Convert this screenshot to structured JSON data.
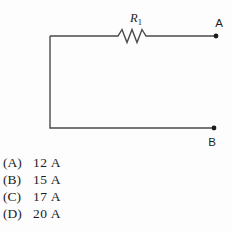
{
  "circuit": {
    "resistor": {
      "base": "R",
      "sub": "1"
    },
    "terminal_a": "A",
    "terminal_b": "B",
    "wire_color": "#4a4a4a",
    "terminal_dot_color": "#1d1d1d",
    "label_color": "#1d1d1d"
  },
  "options": [
    {
      "letter": "(A)",
      "value": "12 A"
    },
    {
      "letter": "(B)",
      "value": "15 A"
    },
    {
      "letter": "(C)",
      "value": "17 A"
    },
    {
      "letter": "(D)",
      "value": "20 A"
    }
  ]
}
